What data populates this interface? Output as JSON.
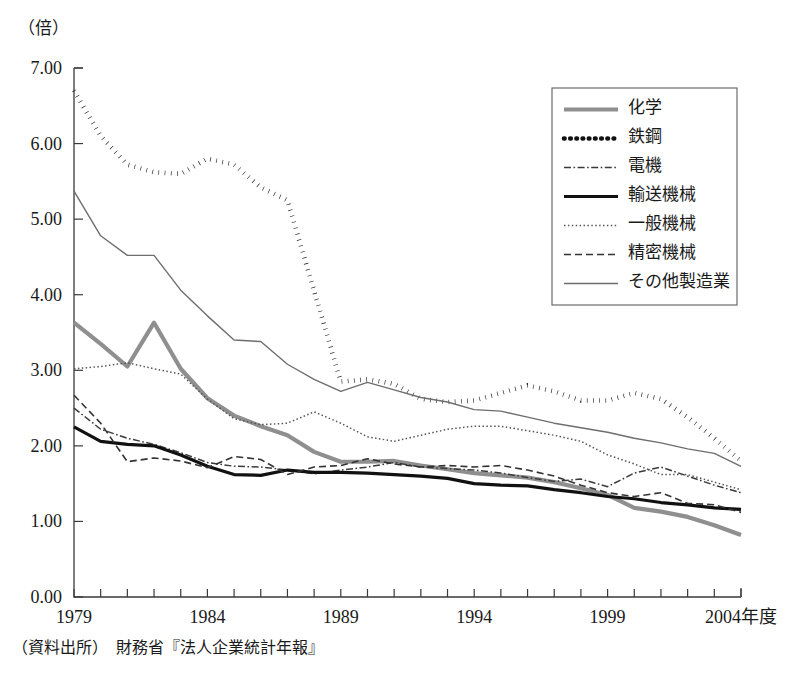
{
  "unit_label": "（倍）",
  "source_note": "（資料出所）　財務省『法人企業統計年報』",
  "axis": {
    "y_ticks": [
      "0.00",
      "1.00",
      "2.00",
      "3.00",
      "4.00",
      "5.00",
      "6.00",
      "7.00"
    ],
    "x_ticks": [
      "1979",
      "1984",
      "1989",
      "1994",
      "1999",
      "2004年度"
    ]
  },
  "legend": {
    "items": [
      {
        "label": "化学",
        "style": "thick-gray-solid"
      },
      {
        "label": "鉄鋼",
        "style": "black-dotted-heavy"
      },
      {
        "label": "電機",
        "style": "dash-dot"
      },
      {
        "label": "輸送機械",
        "style": "thick-black-solid"
      },
      {
        "label": "一般機械",
        "style": "fine-dotted"
      },
      {
        "label": "精密機械",
        "style": "dashed"
      },
      {
        "label": "その他製造業",
        "style": "thin-gray-solid"
      }
    ]
  },
  "chart_data": {
    "type": "line",
    "title": "",
    "xlabel": "年度",
    "ylabel": "倍",
    "xlim": [
      1979,
      2004
    ],
    "ylim": [
      0.0,
      7.0
    ],
    "ytick_step": 1.0,
    "grid": false,
    "legend_position": "top-right",
    "x": [
      1979,
      1980,
      1981,
      1982,
      1983,
      1984,
      1985,
      1986,
      1987,
      1988,
      1989,
      1990,
      1991,
      1992,
      1993,
      1994,
      1995,
      1996,
      1997,
      1998,
      1999,
      2000,
      2001,
      2002,
      2003,
      2004
    ],
    "series": [
      {
        "name": "化学",
        "color": "#8f8f8f",
        "values": [
          3.63,
          3.35,
          3.05,
          3.63,
          3.02,
          2.63,
          2.4,
          2.26,
          2.14,
          1.92,
          1.79,
          1.79,
          1.8,
          1.74,
          1.69,
          1.64,
          1.61,
          1.58,
          1.52,
          1.44,
          1.35,
          1.18,
          1.13,
          1.06,
          0.95,
          0.82
        ]
      },
      {
        "name": "鉄鋼",
        "color": "#111111",
        "values": [
          6.7,
          6.1,
          5.72,
          5.62,
          5.6,
          5.8,
          5.72,
          5.42,
          5.25,
          4.05,
          2.85,
          2.88,
          2.82,
          2.62,
          2.58,
          2.6,
          2.7,
          2.8,
          2.72,
          2.6,
          2.6,
          2.7,
          2.62,
          2.38,
          2.1,
          1.8
        ]
      },
      {
        "name": "電機",
        "color": "#3a3a3a",
        "values": [
          2.5,
          2.22,
          2.1,
          2.02,
          1.91,
          1.78,
          1.73,
          1.72,
          1.68,
          1.63,
          1.68,
          1.72,
          1.78,
          1.72,
          1.7,
          1.68,
          1.64,
          1.58,
          1.53,
          1.56,
          1.46,
          1.64,
          1.72,
          1.6,
          1.48,
          1.38
        ]
      },
      {
        "name": "輸送機械",
        "color": "#111111",
        "values": [
          2.25,
          2.06,
          2.02,
          2.0,
          1.88,
          1.73,
          1.62,
          1.61,
          1.68,
          1.65,
          1.65,
          1.64,
          1.62,
          1.6,
          1.57,
          1.5,
          1.48,
          1.47,
          1.42,
          1.38,
          1.33,
          1.3,
          1.25,
          1.22,
          1.18,
          1.16
        ]
      },
      {
        "name": "一般機械",
        "color": "#555555",
        "values": [
          3.02,
          3.05,
          3.1,
          3.02,
          2.95,
          2.62,
          2.36,
          2.28,
          2.3,
          2.45,
          2.3,
          2.12,
          2.06,
          2.14,
          2.22,
          2.26,
          2.26,
          2.2,
          2.14,
          2.06,
          1.88,
          1.76,
          1.62,
          1.62,
          1.52,
          1.42
        ]
      },
      {
        "name": "精密機械",
        "color": "#333333",
        "values": [
          2.67,
          2.3,
          1.79,
          1.84,
          1.8,
          1.71,
          1.86,
          1.82,
          1.62,
          1.72,
          1.74,
          1.83,
          1.76,
          1.72,
          1.74,
          1.72,
          1.74,
          1.68,
          1.6,
          1.48,
          1.38,
          1.33,
          1.38,
          1.24,
          1.22,
          1.12
        ]
      },
      {
        "name": "その他製造業",
        "color": "#6e6e6e",
        "values": [
          5.37,
          4.78,
          4.52,
          4.52,
          4.06,
          3.72,
          3.4,
          3.38,
          3.08,
          2.88,
          2.72,
          2.84,
          2.74,
          2.64,
          2.58,
          2.48,
          2.46,
          2.38,
          2.3,
          2.24,
          2.18,
          2.1,
          2.04,
          1.96,
          1.9,
          1.73
        ]
      }
    ]
  }
}
